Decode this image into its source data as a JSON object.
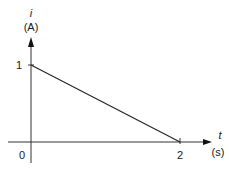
{
  "chart_data": {
    "type": "line",
    "title": "",
    "xlabel": "t",
    "xunit": "(s)",
    "ylabel": "i",
    "yunit": "(A)",
    "xlim": [
      0,
      2.6
    ],
    "ylim": [
      0,
      1.6
    ],
    "origin_label": "0",
    "xticks": [
      {
        "value": 2,
        "label": "2"
      }
    ],
    "yticks": [
      {
        "value": 1,
        "label": "1"
      }
    ],
    "grid": false,
    "series": [
      {
        "name": "i(t)",
        "x": [
          0,
          2
        ],
        "y": [
          1,
          0
        ]
      }
    ]
  }
}
